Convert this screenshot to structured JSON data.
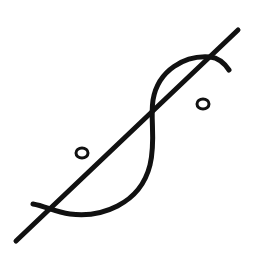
{
  "figure": {
    "description": "Symbol: diagonal straight line crossed by an S-shaped curve, with a small circle on each side",
    "stroke_color": "#111111",
    "background_color": "#ffffff",
    "elements": {
      "diagonal_line": {
        "x1": 16,
        "y1": 241,
        "x2": 238,
        "y2": 30
      },
      "s_curve": "M 33 204 C 45 206, 55 212, 70 214 C 100 218, 140 205, 150 165 C 156 140, 150 120, 153 100 C 158 70, 185 55, 210 57 C 220 58, 225 64, 229 70",
      "circle_left": {
        "cx": 82,
        "cy": 153,
        "rx": 6,
        "ry": 5
      },
      "circle_right": {
        "cx": 203,
        "cy": 104,
        "rx": 6,
        "ry": 5
      }
    }
  }
}
